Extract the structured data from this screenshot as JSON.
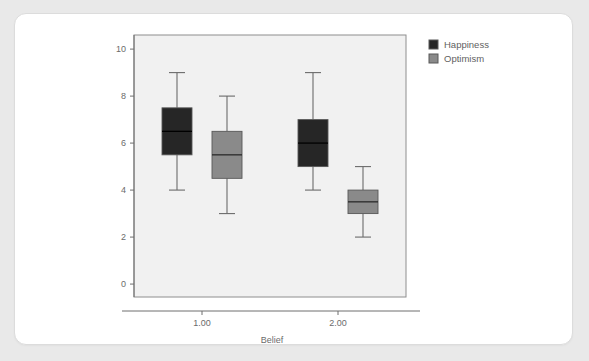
{
  "card": {
    "background": "#ffffff",
    "page_background": "#e9e9e9"
  },
  "legend": {
    "position": "top-right",
    "entries": [
      {
        "label": "Happiness",
        "color": "#262626",
        "swatch": "legend-swatch-happiness"
      },
      {
        "label": "Optimism",
        "color": "#8a8a8a",
        "swatch": "legend-swatch-optimism"
      }
    ]
  },
  "chart_data": {
    "type": "box",
    "title": "",
    "xlabel": "Belief",
    "ylabel": "",
    "categories": [
      "1.00",
      "2.00"
    ],
    "x_tick_labels": [
      "1.00",
      "2.00"
    ],
    "y_tick_labels": [
      "0",
      "2",
      "4",
      "6",
      "8",
      "10"
    ],
    "y_ticks": [
      0,
      2,
      4,
      6,
      8,
      10
    ],
    "ylim": [
      -0.55,
      10.6
    ],
    "grid": false,
    "legend_position": "top-right",
    "plot_background": "#f1f1f1",
    "series": [
      {
        "name": "Happiness",
        "color": "#262626",
        "boxes": [
          {
            "category": "1.00",
            "whisker_low": 4.0,
            "q1": 5.5,
            "median": 6.5,
            "q3": 7.5,
            "whisker_high": 9.0
          },
          {
            "category": "2.00",
            "whisker_low": 4.0,
            "q1": 5.0,
            "median": 6.0,
            "q3": 7.0,
            "whisker_high": 9.0
          }
        ]
      },
      {
        "name": "Optimism",
        "color": "#8a8a8a",
        "boxes": [
          {
            "category": "1.00",
            "whisker_low": 3.0,
            "q1": 4.5,
            "median": 5.5,
            "q3": 6.5,
            "whisker_high": 8.0
          },
          {
            "category": "2.00",
            "whisker_low": 2.0,
            "q1": 3.0,
            "median": 3.5,
            "q3": 4.0,
            "whisker_high": 5.0
          }
        ]
      }
    ]
  }
}
